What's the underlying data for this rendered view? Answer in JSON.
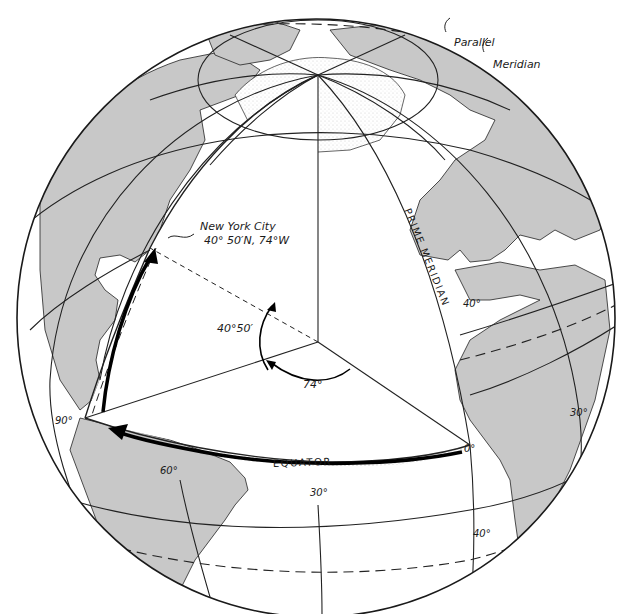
{
  "figure": {
    "colors": {
      "land": "#c8c8c8",
      "ocean": "#ffffff",
      "lines": "#1a1a1a",
      "stipple": "#555555"
    },
    "callouts": {
      "parallel": "Parallel",
      "meridian": "Meridian"
    },
    "location": {
      "name": "New York City",
      "coords": "40° 50′N, 74°W"
    },
    "angles": {
      "latitude": "40°50′",
      "longitude": "74°"
    },
    "lines": {
      "prime_meridian": "PRIME MERIDIAN",
      "equator": "EQUATOR"
    },
    "degree_labels": {
      "equator_origin": "0°",
      "lon_90": "90°",
      "lon_60": "60°",
      "lon_30_south": "30°",
      "lon_30_east": "30°",
      "lat_40_north": "40°",
      "lat_40_south": "40°"
    }
  }
}
